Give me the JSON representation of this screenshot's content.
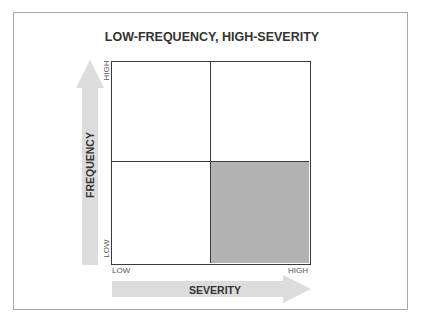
{
  "diagram": {
    "title": "LOW-FREQUENCY, HIGH-SEVERITY",
    "y_axis": {
      "title": "FREQUENCY",
      "low_label": "LOW",
      "high_label": "HIGH",
      "arrow_direction": "up"
    },
    "x_axis": {
      "title": "SEVERITY",
      "low_label": "LOW",
      "high_label": "HIGH",
      "arrow_direction": "right"
    },
    "quadrants": [
      {
        "position": "top-left",
        "frequency": "HIGH",
        "severity": "LOW",
        "highlighted": false
      },
      {
        "position": "top-right",
        "frequency": "HIGH",
        "severity": "HIGH",
        "highlighted": false
      },
      {
        "position": "bottom-left",
        "frequency": "LOW",
        "severity": "LOW",
        "highlighted": false
      },
      {
        "position": "bottom-right",
        "frequency": "LOW",
        "severity": "HIGH",
        "highlighted": true
      }
    ],
    "colors": {
      "highlight_fill": "#b3b3b3",
      "arrow_fill": "#dcdcdc",
      "grid_line": "#3a3a3a",
      "frame_border": "#a8a8a8",
      "text": "#333333"
    }
  }
}
